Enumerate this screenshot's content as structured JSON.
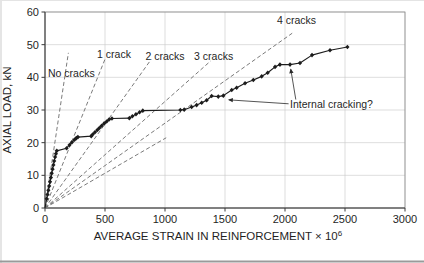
{
  "chart_data": {
    "type": "line",
    "title": "",
    "xlabel_base": "AVERAGE STRAIN IN REINFORCEMENT × 10",
    "xlabel_exponent": "6",
    "ylabel": "AXIAL LOAD, kN",
    "xlim": [
      0,
      3000
    ],
    "ylim": [
      0,
      60
    ],
    "xticks": [
      0,
      500,
      1000,
      1500,
      2000,
      2500,
      3000
    ],
    "yticks": [
      0,
      10,
      20,
      30,
      40,
      50,
      60
    ],
    "grid": true,
    "legend": "none",
    "series": [
      {
        "points": [
          [
            0,
            0
          ],
          [
            14,
            2.8
          ],
          [
            21,
            4.1
          ],
          [
            28,
            5.4
          ],
          [
            35,
            6.7
          ],
          [
            42,
            8.0
          ],
          [
            49,
            9.3
          ],
          [
            56,
            10.6
          ],
          [
            63,
            11.9
          ],
          [
            70,
            13.2
          ],
          [
            77,
            14.4
          ],
          [
            84,
            15.6
          ],
          [
            91,
            16.6
          ],
          [
            98,
            17.5
          ],
          [
            180,
            18.3
          ],
          [
            204,
            19.3
          ],
          [
            224,
            20.1
          ],
          [
            246,
            20.9
          ],
          [
            261,
            21.4
          ],
          [
            274,
            21.7
          ],
          [
            385,
            22.0
          ],
          [
            397,
            22.5
          ],
          [
            416,
            23.2
          ],
          [
            436,
            23.9
          ],
          [
            453,
            24.5
          ],
          [
            472,
            25.2
          ],
          [
            493,
            25.9
          ],
          [
            514,
            26.5
          ],
          [
            534,
            27.1
          ],
          [
            558,
            27.4
          ],
          [
            703,
            27.5
          ],
          [
            728,
            28.1
          ],
          [
            758,
            28.7
          ],
          [
            788,
            29.3
          ],
          [
            815,
            29.8
          ],
          [
            1128,
            30.0
          ],
          [
            1160,
            30.1
          ],
          [
            1222,
            30.9
          ],
          [
            1264,
            31.5
          ],
          [
            1306,
            32.2
          ],
          [
            1347,
            33.0
          ],
          [
            1389,
            34.3
          ],
          [
            1444,
            34.1
          ],
          [
            1486,
            34.4
          ],
          [
            1556,
            36.1
          ],
          [
            1597,
            36.8
          ],
          [
            1667,
            38.2
          ],
          [
            1736,
            39.2
          ],
          [
            1806,
            40.3
          ],
          [
            1856,
            41.4
          ],
          [
            1917,
            43.2
          ],
          [
            1958,
            43.9
          ],
          [
            2042,
            43.9
          ],
          [
            2125,
            44.4
          ],
          [
            2225,
            46.8
          ],
          [
            2375,
            48.3
          ],
          [
            2520,
            49.3
          ]
        ]
      }
    ],
    "crack_lines": [
      {
        "label": "No cracks",
        "end": [
          195,
          47.5
        ],
        "label_pos": [
          25,
          41.3
        ],
        "anchor": "start"
      },
      {
        "label": "1 crack",
        "end": [
          505,
          46.0
        ],
        "label_pos": [
          575,
          47.0
        ],
        "anchor": "middle"
      },
      {
        "label": "2 cracks",
        "end": [
          885,
          45.5
        ],
        "label_pos": [
          1000,
          46.5
        ],
        "anchor": "middle"
      },
      {
        "label": "3 cracks",
        "end": [
          1380,
          45.0
        ],
        "label_pos": [
          1405,
          46.5
        ],
        "anchor": "middle"
      },
      {
        "label": "4 cracks",
        "end": [
          2060,
          53.5
        ],
        "label_pos": [
          2096,
          57.3
        ],
        "anchor": "middle"
      },
      {
        "label": "",
        "end": [
          1010,
          21.5
        ],
        "label_pos": null,
        "anchor": "middle"
      }
    ],
    "annotation": {
      "text": "Internal cracking?",
      "text_x": 2042,
      "text_y": 31.6,
      "arrows": [
        {
          "x1": 2030,
          "y1": 31.9,
          "x2": 1532,
          "y2": 33.1
        },
        {
          "x1": 2090,
          "y1": 33.2,
          "x2": 2048,
          "y2": 42.5
        }
      ]
    },
    "colors": {
      "curve": "#1c1c1c",
      "crack_lines": "#6b6b6b",
      "grid": "#c8c8c8",
      "frame": "#8c8c8c",
      "axis": "#3a3a3a",
      "text": "#1f1f1f"
    }
  }
}
